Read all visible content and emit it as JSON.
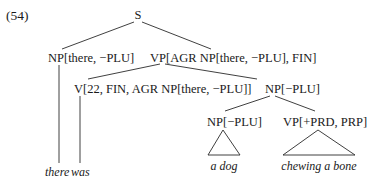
{
  "example_number": "(54)",
  "nodes": {
    "s": "S",
    "np_there": "NP[there, −PLU]",
    "vp_top": "VP[AGR NP[there, −PLU], FIN]",
    "v": "V[22, FIN, AGR NP[there, −PLU]]",
    "np_obj": "NP[−PLU]",
    "np_dog": "NP[−PLU]",
    "vp_prd": "VP[+PRD, PRP]"
  },
  "leaves": {
    "there": "there",
    "was": "was",
    "a_dog": "a dog",
    "chewing": "chewing a bone"
  },
  "triangle_abbreviated": [
    "a dog",
    "chewing a bone"
  ]
}
